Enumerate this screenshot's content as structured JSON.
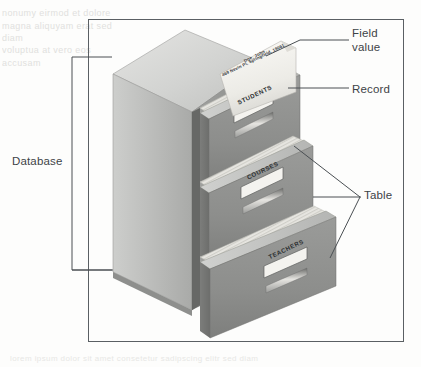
{
  "figure": {
    "background_color": "#fdfdfc",
    "frame_color": "#5a5f63"
  },
  "annotations": [
    {
      "id": "field-value",
      "label": "Field\nvalue"
    },
    {
      "id": "record",
      "label": "Record"
    },
    {
      "id": "table",
      "label": "Table"
    },
    {
      "id": "database",
      "label": "Database"
    }
  ],
  "cabinet": {
    "drawers": [
      {
        "id": "students",
        "label": "STUDENTS"
      },
      {
        "id": "courses",
        "label": "COURSES"
      },
      {
        "id": "teachers",
        "label": "TEACHERS"
      }
    ],
    "colors": {
      "top_face": "#d8d8d6",
      "side_face": "#b6b7b5",
      "front_face": "#9a9b99",
      "drawer_front": "#8e8f8d",
      "drawer_top": "#c4c5c3",
      "paper": "#e9e8e4",
      "label_plate": "#f4f3ef"
    }
  },
  "record_sheet": {
    "line1": "Doe, John",
    "line2": "469 Nevin Pl, Springfield, 19061"
  },
  "ghost_text": {
    "top": "nonumy eirmod et dolore\nmagna aliquyam erat sed diam\nvoluptua at vero eos accusam",
    "bottom": "lorem ipsum dolor sit amet consetetur sadipscing elitr sed diam"
  }
}
